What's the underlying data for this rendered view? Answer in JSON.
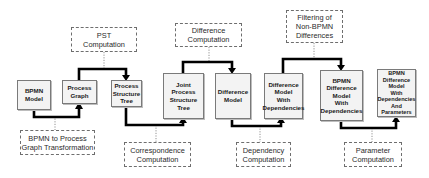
{
  "diagram": {
    "type": "process-pipeline",
    "artifacts": [
      {
        "id": "bpmn_model",
        "label": "BPMN\nModel"
      },
      {
        "id": "process_graph",
        "label": "Process\nGraph"
      },
      {
        "id": "pst",
        "label": "Process\nStructure\nTree"
      },
      {
        "id": "joint_pst",
        "label": "Joint\nProcess\nStructure\nTree"
      },
      {
        "id": "difference_model",
        "label": "Difference\nModel"
      },
      {
        "id": "diff_with_deps",
        "label": "Difference\nModel\nWith\nDependencies"
      },
      {
        "id": "bpmn_diff_with_deps",
        "label": "BPMN\nDifference\nModel\nWith\nDependencies"
      },
      {
        "id": "bpmn_diff_with_deps_params",
        "label": "BPMN\nDifference\nModel\nWith\nDependencies\nAnd\nParameters"
      }
    ],
    "operations": [
      {
        "id": "bpmn_to_pg",
        "label": "BPMN to Process\nGraph Transformation",
        "from": "bpmn_model",
        "to": "process_graph",
        "position": "below"
      },
      {
        "id": "pst_comp",
        "label": "PST\nComputation",
        "from": "process_graph",
        "to": "pst",
        "position": "above"
      },
      {
        "id": "corr_comp",
        "label": "Correspondence\nComputation",
        "from": "pst",
        "to": "joint_pst",
        "position": "below"
      },
      {
        "id": "diff_comp",
        "label": "Difference\nComputation",
        "from": "joint_pst",
        "to": "difference_model",
        "position": "above"
      },
      {
        "id": "dep_comp",
        "label": "Dependency\nComputation",
        "from": "difference_model",
        "to": "diff_with_deps",
        "position": "below"
      },
      {
        "id": "filter",
        "label": "Filtering of\nNon-BPMN\nDifferences",
        "from": "diff_with_deps",
        "to": "bpmn_diff_with_deps",
        "position": "above"
      },
      {
        "id": "param_comp",
        "label": "Parameter\nComputation",
        "from": "bpmn_diff_with_deps",
        "to": "bpmn_diff_with_deps_params",
        "position": "below"
      }
    ]
  },
  "colors": {
    "node_fill": "#f3f3f3",
    "node_border": "#7a7a7a",
    "arrow": "#000000",
    "dashed_border": "#6e6e6e"
  }
}
